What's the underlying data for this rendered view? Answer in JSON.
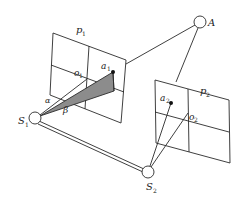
{
  "diagram": {
    "type": "stereo-vision-geometry",
    "labels": {
      "point_A": "A",
      "station_1": "S",
      "station_1_sub": "1",
      "station_2": "S",
      "station_2_sub": "2",
      "plane_1": "p",
      "plane_1_sub": "1",
      "plane_2": "p",
      "plane_2_sub": "2",
      "image_point_1": "a",
      "image_point_1_sub": "1",
      "image_point_2": "a",
      "image_point_2_sub": "2",
      "principal_1": "o",
      "principal_1_sub": "1",
      "principal_2": "o",
      "principal_2_sub": "2",
      "angle_alpha": "α",
      "angle_beta": "β"
    },
    "colors": {
      "stroke": "#2a2a2a",
      "shade": "#8c8c8c",
      "background": "#ffffff"
    }
  }
}
